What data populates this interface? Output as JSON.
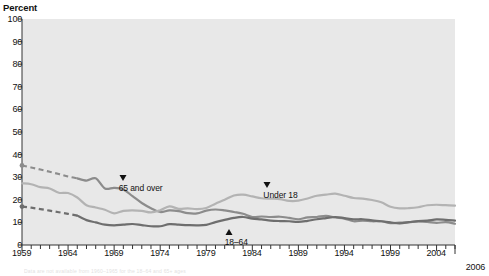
{
  "chart": {
    "y_axis_title": "Percent",
    "end_year_label": "2006",
    "footnote": "Data are not available from 1960–1965 for the 18–64 and 65+ ages",
    "colors": {
      "plot_background": "#e8e8e8",
      "under18": "#b3b3b3",
      "age65plus": "#8c8c8c",
      "age18to64": "#6e6e6e",
      "text": "#111111"
    }
  },
  "labels": {
    "under18": "Under 18",
    "age65plus": "65 and over",
    "age18to64": "18–64"
  },
  "chart_data": {
    "type": "line",
    "title": "",
    "xlabel": "",
    "ylabel": "Percent",
    "ylim": [
      0,
      100
    ],
    "xlim": [
      1959,
      2006
    ],
    "yticks": [
      0,
      10,
      20,
      30,
      40,
      50,
      60,
      70,
      80,
      90,
      100
    ],
    "xticks": [
      1959,
      1964,
      1969,
      1974,
      1979,
      1984,
      1989,
      1994,
      1999,
      2004
    ],
    "xtick_labels": [
      "1959",
      "1964",
      "1969",
      "1974",
      "1979",
      "1984",
      "1989",
      "1994",
      "1999",
      "2004"
    ],
    "grid": false,
    "legend": "inline-annotations",
    "x": [
      1959,
      1960,
      1961,
      1962,
      1963,
      1964,
      1965,
      1966,
      1967,
      1968,
      1969,
      1970,
      1971,
      1972,
      1973,
      1974,
      1975,
      1976,
      1977,
      1978,
      1979,
      1980,
      1981,
      1982,
      1983,
      1984,
      1985,
      1986,
      1987,
      1988,
      1989,
      1990,
      1991,
      1992,
      1993,
      1994,
      1995,
      1996,
      1997,
      1998,
      1999,
      2000,
      2001,
      2002,
      2003,
      2004,
      2005,
      2006
    ],
    "series": [
      {
        "name": "65 and over",
        "color": "#8c8c8c",
        "dashed_range": [
          1959,
          1965
        ],
        "marker_style": "down-triangle",
        "values": [
          35.2,
          34.3,
          33.4,
          32.4,
          31.4,
          30.3,
          29.5,
          28.5,
          29.5,
          25.0,
          25.3,
          24.6,
          21.6,
          18.6,
          16.3,
          14.6,
          15.3,
          15.0,
          14.1,
          14.0,
          15.2,
          15.7,
          15.3,
          14.6,
          13.8,
          12.4,
          12.6,
          12.4,
          12.5,
          12.0,
          11.4,
          12.2,
          12.4,
          12.9,
          12.2,
          11.7,
          10.5,
          10.8,
          10.5,
          10.5,
          9.7,
          9.9,
          10.1,
          10.4,
          10.2,
          9.8,
          10.1,
          9.4
        ]
      },
      {
        "name": "Under 18",
        "color": "#b3b3b3",
        "dashed_range": null,
        "marker_style": "down-triangle",
        "values": [
          27.3,
          26.9,
          25.6,
          25.0,
          23.1,
          23.0,
          21.0,
          17.6,
          16.6,
          15.6,
          14.0,
          15.1,
          15.3,
          15.1,
          14.4,
          15.4,
          17.1,
          16.0,
          16.2,
          15.9,
          16.4,
          18.3,
          20.0,
          21.9,
          22.3,
          21.5,
          20.7,
          20.5,
          20.3,
          19.5,
          19.6,
          20.6,
          21.8,
          22.3,
          22.7,
          21.8,
          20.8,
          20.5,
          19.9,
          18.9,
          16.9,
          16.2,
          16.3,
          16.7,
          17.6,
          17.8,
          17.6,
          17.4
        ]
      },
      {
        "name": "18–64",
        "color": "#6e6e6e",
        "dashed_range": [
          1959,
          1965
        ],
        "marker_style": "up-triangle",
        "values": [
          17.0,
          16.5,
          15.9,
          15.2,
          14.5,
          13.8,
          13.0,
          11.0,
          10.0,
          9.0,
          8.7,
          9.0,
          9.3,
          8.8,
          8.3,
          8.3,
          9.2,
          9.0,
          8.8,
          8.7,
          8.9,
          10.1,
          11.1,
          12.0,
          12.4,
          11.7,
          11.3,
          10.8,
          10.6,
          10.5,
          10.2,
          10.7,
          11.4,
          11.9,
          12.4,
          11.9,
          11.4,
          11.4,
          10.9,
          10.5,
          10.0,
          9.6,
          10.1,
          10.6,
          10.8,
          11.3,
          11.1,
          10.8
        ]
      }
    ],
    "annotations": [
      {
        "text": "65 and over",
        "marker": "down-triangle",
        "x_year": 1969.5,
        "y_value": 29.0
      },
      {
        "text": "Under 18",
        "marker": "down-triangle",
        "x_year": 1985.2,
        "y_value": 26.0
      },
      {
        "text": "18–64",
        "marker": "up-triangle",
        "x_year": 1981.0,
        "y_value": 5.5
      }
    ]
  }
}
